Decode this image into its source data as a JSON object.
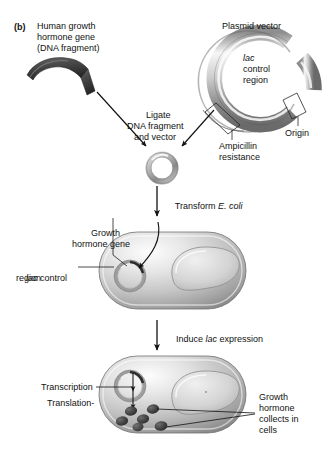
{
  "figure": {
    "panel_label": "(b)",
    "domain": "molecular-biology-diagram",
    "title_implicit": "Cloning and expression of human growth hormone gene in E. coli"
  },
  "labels": {
    "panel": "(b)",
    "fragment_l1": "Human growth",
    "fragment_l2": "hormone gene",
    "fragment_l3": "(DNA fragment)",
    "plasmid_vector": "Plasmid vector",
    "lac_italic": "lac",
    "lac_l2": "control",
    "lac_l3": "region",
    "ligate_l1": "Ligate",
    "ligate_l2": "DNA fragment",
    "ligate_l3": "and vector",
    "ampicillin_l1": "Ampicillin",
    "ampicillin_l2": "resistance",
    "origin": "Origin",
    "transform_pre": "Transform ",
    "transform_italic": "E. coli",
    "growth_gene_l1": "Growth",
    "growth_gene_l2": "hormone gene",
    "lac_ctrl_italic": "lac",
    "lac_ctrl_rest": " control",
    "lac_ctrl_l2": "region",
    "induce_pre": "Induce ",
    "induce_italic": "lac",
    "induce_post": " expression",
    "transcription": "Transcription",
    "translation": "Translation",
    "collects_l1": "Growth",
    "collects_l2": "hormone",
    "collects_l3": "collects in",
    "collects_l4": "cells"
  },
  "colors": {
    "ink": "#111111",
    "fragment_dark": "#4a4a4a",
    "fragment_darker": "#2e2e2e",
    "plasmid_light": "#f2f2f2",
    "plasmid_mid": "#a8a8a8",
    "plasmid_dark": "#6e6e6e",
    "cell_light": "#efefef",
    "cell_mid": "#b9b9b9",
    "cell_dark": "#7d7d7d",
    "protein_dark": "#3c3c3c",
    "background": "#ffffff"
  },
  "counts": {
    "protein_blobs": 6,
    "ligate_arrows": 2,
    "step_arrows": 2
  }
}
